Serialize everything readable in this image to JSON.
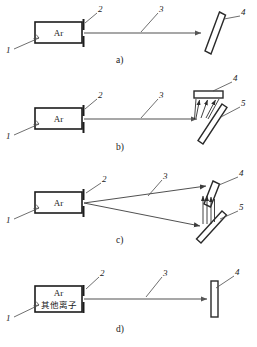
{
  "figure": {
    "width": 257,
    "height": 347,
    "colors": {
      "background": "#ffffff",
      "outline": "#1c1c1c",
      "beam": "#8a8a8a",
      "ray": "#3c3c3c",
      "leader": "#4a4a4a",
      "text": "#1a1a1a"
    }
  },
  "callouts": {
    "source": "1",
    "aperture": "2",
    "beam": "3",
    "target": "4",
    "plate": "5"
  },
  "panels": [
    {
      "id": "a",
      "label": "a)",
      "source_label": "Ar",
      "source_sublabel": "",
      "callouts": [
        "1",
        "2",
        "3",
        "4"
      ],
      "target_type": "tilted-plate",
      "beam_type": "single-straight"
    },
    {
      "id": "b",
      "label": "b)",
      "source_label": "Ar",
      "source_sublabel": "",
      "callouts": [
        "1",
        "2",
        "3",
        "4",
        "5"
      ],
      "target_type": "detector-over-tilted-plate",
      "beam_type": "single-straight"
    },
    {
      "id": "c",
      "label": "c)",
      "source_label": "Ar",
      "source_sublabel": "",
      "callouts": [
        "1",
        "2",
        "3",
        "4",
        "5"
      ],
      "target_type": "two-tilted-plates",
      "beam_type": "diverging-pair"
    },
    {
      "id": "d",
      "label": "d)",
      "source_label": "Ar",
      "source_sublabel": "其他离子",
      "callouts": [
        "1",
        "2",
        "3",
        "4"
      ],
      "target_type": "vertical-plate",
      "beam_type": "single-straight"
    }
  ]
}
